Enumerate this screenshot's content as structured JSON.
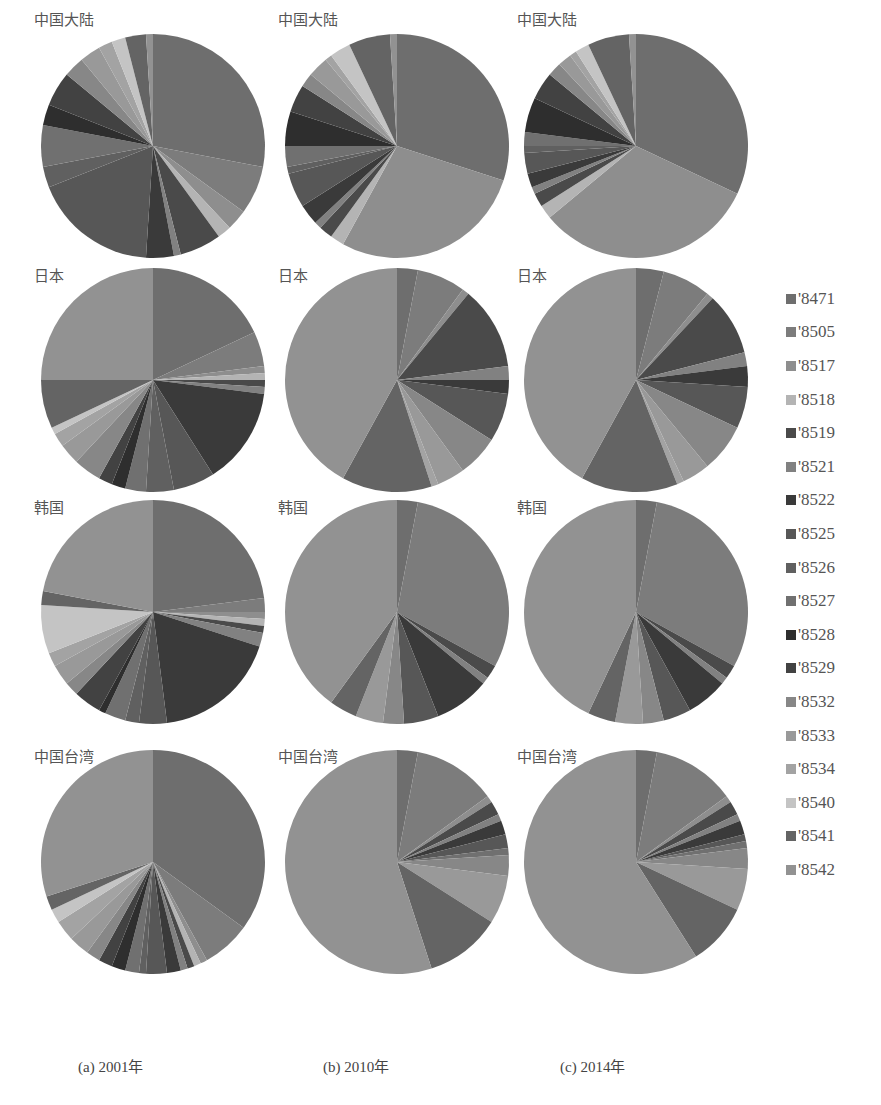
{
  "legend": {
    "items": [
      {
        "label": "'8471",
        "color": "#6e6e6e"
      },
      {
        "label": "'8505",
        "color": "#7c7c7c"
      },
      {
        "label": "'8517",
        "color": "#8e8e8e"
      },
      {
        "label": "'8518",
        "color": "#b4b4b4"
      },
      {
        "label": "'8519",
        "color": "#4a4a4a"
      },
      {
        "label": "'8521",
        "color": "#818181"
      },
      {
        "label": "'8522",
        "color": "#3a3a3a"
      },
      {
        "label": "'8525",
        "color": "#575757"
      },
      {
        "label": "'8526",
        "color": "#606060"
      },
      {
        "label": "'8527",
        "color": "#707070"
      },
      {
        "label": "'8528",
        "color": "#2e2e2e"
      },
      {
        "label": "'8529",
        "color": "#424242"
      },
      {
        "label": "'8532",
        "color": "#878787"
      },
      {
        "label": "'8533",
        "color": "#999999"
      },
      {
        "label": "'8534",
        "color": "#a3a3a3"
      },
      {
        "label": "'8540",
        "color": "#c4c4c4"
      },
      {
        "label": "'8541",
        "color": "#646464"
      },
      {
        "label": "'8542",
        "color": "#929292"
      }
    ]
  },
  "captions": [
    "(a) 2001年",
    "(b) 2010年",
    "(c) 2014年"
  ],
  "row_labels": [
    "中国大陆",
    "日本",
    "韩国",
    "中国台湾"
  ],
  "chart_data": {
    "type": "pie",
    "title": "",
    "legend_position": "right",
    "categories": [
      "'8471",
      "'8505",
      "'8517",
      "'8518",
      "'8519",
      "'8521",
      "'8522",
      "'8525",
      "'8526",
      "'8527",
      "'8528",
      "'8529",
      "'8532",
      "'8533",
      "'8534",
      "'8540",
      "'8541",
      "'8542"
    ],
    "panels": [
      {
        "row": "中国大陆",
        "year": "2001",
        "caption": "(a) 2001年",
        "values": [
          28,
          7,
          3,
          2,
          6,
          1,
          4,
          18,
          3,
          6,
          3,
          5,
          3,
          3,
          2,
          2,
          3,
          1
        ]
      },
      {
        "row": "中国大陆",
        "year": "2010",
        "caption": "(b) 2010年",
        "values": [
          30,
          0,
          28,
          2,
          2,
          1,
          3,
          5,
          1,
          3,
          5,
          4,
          2,
          3,
          1,
          3,
          6,
          1
        ]
      },
      {
        "row": "中国大陆",
        "year": "2014",
        "caption": "(c) 2014年",
        "values": [
          32,
          0,
          32,
          2,
          2,
          1,
          2,
          3,
          1,
          2,
          5,
          4,
          2,
          2,
          1,
          2,
          6,
          1
        ]
      },
      {
        "row": "日本",
        "year": "2001",
        "caption": "(a) 2001年",
        "values": [
          18,
          5,
          1,
          1,
          1,
          1,
          14,
          6,
          4,
          3,
          2,
          2,
          4,
          3,
          2,
          1,
          7,
          25
        ]
      },
      {
        "row": "日本",
        "year": "2010",
        "caption": "(b) 2010年",
        "values": [
          3,
          7,
          1,
          0,
          12,
          2,
          2,
          7,
          0,
          0,
          0,
          0,
          6,
          4,
          1,
          0,
          13,
          42
        ]
      },
      {
        "row": "日本",
        "year": "2014",
        "caption": "(c) 2014年",
        "values": [
          4,
          7,
          1,
          0,
          9,
          2,
          3,
          6,
          0,
          0,
          0,
          0,
          7,
          4,
          1,
          0,
          14,
          42
        ]
      },
      {
        "row": "韩国",
        "year": "2001",
        "caption": "(a) 2001年",
        "values": [
          23,
          2,
          1,
          1,
          1,
          2,
          18,
          4,
          2,
          3,
          1,
          4,
          2,
          3,
          2,
          7,
          2,
          22
        ]
      },
      {
        "row": "韩国",
        "year": "2010",
        "caption": "(b) 2010年",
        "values": [
          3,
          30,
          0,
          0,
          2,
          1,
          8,
          5,
          0,
          0,
          0,
          0,
          3,
          4,
          0,
          0,
          4,
          40
        ]
      },
      {
        "row": "韩国",
        "year": "2014",
        "caption": "(c) 2014年",
        "values": [
          3,
          30,
          0,
          0,
          2,
          1,
          6,
          4,
          0,
          0,
          0,
          0,
          3,
          4,
          0,
          0,
          4,
          43
        ]
      },
      {
        "row": "中国台湾",
        "year": "2001",
        "caption": "(a) 2001年",
        "values": [
          35,
          7,
          1,
          1,
          1,
          1,
          2,
          3,
          1,
          2,
          2,
          2,
          2,
          3,
          3,
          2,
          2,
          30
        ]
      },
      {
        "row": "中国台湾",
        "year": "2010",
        "caption": "(b) 2010年",
        "values": [
          3,
          12,
          1,
          0,
          2,
          1,
          2,
          2,
          0,
          1,
          0,
          0,
          3,
          7,
          0,
          0,
          11,
          55
        ]
      },
      {
        "row": "中国台湾",
        "year": "2014",
        "caption": "(c) 2014年",
        "values": [
          3,
          12,
          1,
          0,
          2,
          1,
          2,
          1,
          0,
          1,
          0,
          0,
          3,
          6,
          0,
          0,
          9,
          59
        ]
      }
    ]
  }
}
